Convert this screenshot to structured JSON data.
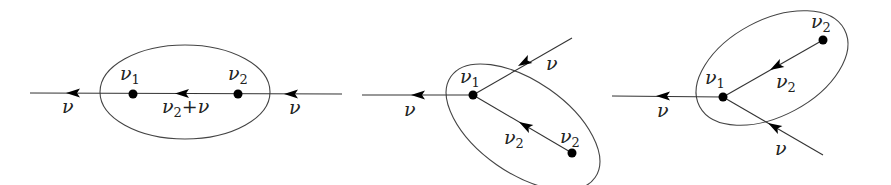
{
  "figure": {
    "panels": [
      {
        "id": "panel-1",
        "nodes": [
          {
            "label": "ν",
            "sub": "1",
            "x": 133,
            "y": 94
          },
          {
            "label": "ν",
            "sub": "2",
            "x": 238,
            "y": 94
          }
        ],
        "edge_labels": {
          "outgoing": "ν",
          "incoming": "ν",
          "internal_base": "ν",
          "internal_sub": "2",
          "internal_op": "+",
          "internal_tail": "ν"
        }
      },
      {
        "id": "panel-2",
        "nodes": [
          {
            "label": "ν",
            "sub": "1",
            "x": 473,
            "y": 95
          },
          {
            "label": "ν",
            "sub": "2",
            "x": 572,
            "y": 153
          }
        ],
        "edge_labels": {
          "outgoing": "ν",
          "incoming": "ν",
          "internal_base": "ν",
          "internal_sub": "2"
        }
      },
      {
        "id": "panel-3",
        "nodes": [
          {
            "label": "ν",
            "sub": "1",
            "x": 723,
            "y": 97
          },
          {
            "label": "ν",
            "sub": "2",
            "x": 823,
            "y": 40
          }
        ],
        "edge_labels": {
          "outgoing": "ν",
          "incoming": "ν",
          "internal_base": "ν",
          "internal_sub": "2"
        }
      }
    ]
  }
}
